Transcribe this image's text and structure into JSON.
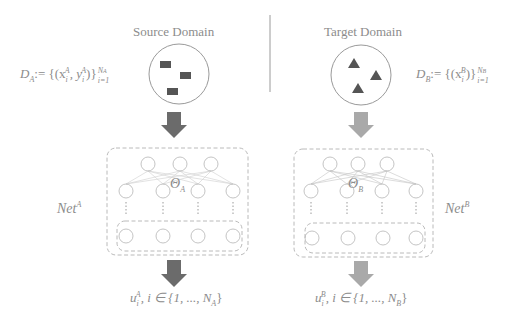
{
  "source": {
    "title": "Source Domain",
    "dataset_label": "D_A := {(x_i^A, y_i^A)}_{i=1}^{N_A}",
    "dataset_parts": {
      "D": "D",
      "sub": "A",
      "body": ":= {(x",
      "xsup": "A",
      "xsub": "i",
      "mid": ", y",
      "ysup": "A",
      "ysub": "i",
      "close": ")}",
      "upper": "N",
      "upper_sub": "A",
      "lower": "i=1"
    },
    "sample_shape": "square",
    "network_label": {
      "base": "Net",
      "sup": "A"
    },
    "param_label": {
      "base": "Θ",
      "sub": "A"
    },
    "output_label": {
      "u": "u",
      "sup": "A",
      "sub": "i",
      "rest": ", i ∈ {1, ..., N",
      "rest_sub": "A",
      "close": "}"
    },
    "arrow_color": "#6b6b6b"
  },
  "target": {
    "title": "Target Domain",
    "dataset_label": "D_B := {(x_i^B)}_{i=1}^{N_B}",
    "dataset_parts": {
      "D": "D",
      "sub": "B",
      "body": ":= {(x",
      "xsup": "B",
      "xsub": "i",
      "close": ")}",
      "upper": "N",
      "upper_sub": "B",
      "lower": "i=1"
    },
    "sample_shape": "triangle",
    "network_label": {
      "base": "Net",
      "sup": "B"
    },
    "param_label": {
      "base": "Θ",
      "sub": "B"
    },
    "output_label": {
      "u": "u",
      "sup": "B",
      "sub": "i",
      "rest": ", i ∈ {1, ..., N",
      "rest_sub": "B",
      "close": "}"
    },
    "arrow_color": "#a9a9a9"
  },
  "colors": {
    "line": "#b5b5b5",
    "dashed_box": "#a8a8a8",
    "shape_fill": "#555555",
    "divider": "#9a9a9a"
  }
}
